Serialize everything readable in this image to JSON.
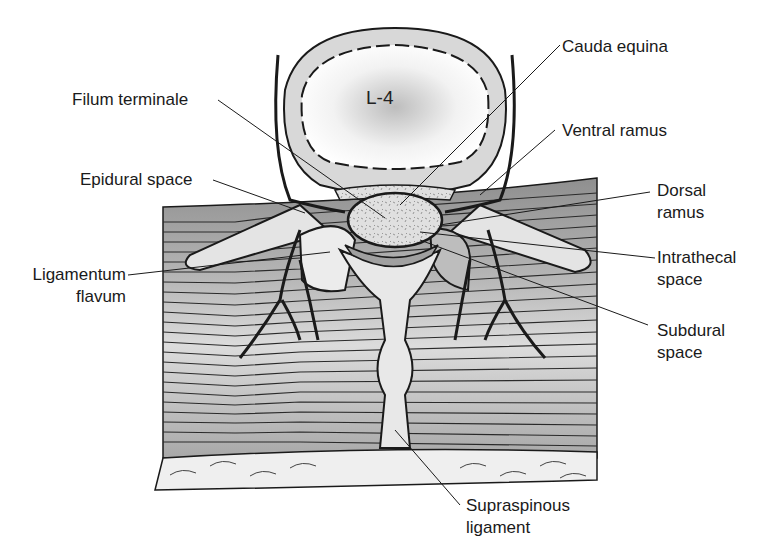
{
  "figure": {
    "vertebra_label": "L-4",
    "labels": {
      "cauda_equina": "Cauda equina",
      "filum_terminale": "Filum terminale",
      "ventral_ramus": "Ventral ramus",
      "epidural_space": "Epidural space",
      "dorsal_ramus_line1": "Dorsal",
      "dorsal_ramus_line2": "ramus",
      "intrathecal_space_line1": "Intrathecal",
      "intrathecal_space_line2": "space",
      "ligamentum_flavum_line1": "Ligamentum",
      "ligamentum_flavum_line2": "flavum",
      "subdural_space_line1": "Subdural",
      "subdural_space_line2": "space",
      "supraspinous_ligament_line1": "Supraspinous",
      "supraspinous_ligament_line2": "ligament"
    },
    "colors": {
      "bone": "#e6e6e6",
      "muscle_dark": "#9a9a9a",
      "muscle_light": "#d4d4d4",
      "outline": "#1a1a1a",
      "fat": "#efefef"
    }
  }
}
